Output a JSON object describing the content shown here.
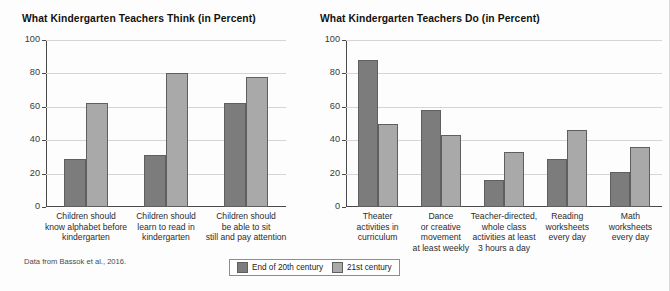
{
  "source_note": "Data from Bassok et al., 2016.",
  "legend": {
    "position": "bottom-center",
    "items": [
      {
        "label": "End of 20th century",
        "color": "#7c7c7c"
      },
      {
        "label": "21st century",
        "color": "#a9a9a9"
      }
    ]
  },
  "chart_data": [
    {
      "type": "bar",
      "title": "What Kindergarten Teachers Think (in Percent)",
      "xlabel": "",
      "ylabel": "",
      "ylim": [
        0,
        100
      ],
      "yticks": [
        0,
        20,
        40,
        60,
        80,
        100
      ],
      "grid": true,
      "categories": [
        "Children should know alphabet before kindergarten",
        "Children should learn to read in kindergarten",
        "Children should be able to sit still and pay attention"
      ],
      "category_lines": [
        [
          "Children should",
          "know alphabet before",
          "kindergarten"
        ],
        [
          "Children should",
          "learn to read in",
          "kindergarten"
        ],
        [
          "Children should",
          "be able to sit",
          "still and pay attention"
        ]
      ],
      "series": [
        {
          "name": "End of 20th century",
          "color": "#7c7c7c",
          "values": [
            29,
            31,
            62
          ]
        },
        {
          "name": "21st century",
          "color": "#a9a9a9",
          "values": [
            62,
            80,
            78
          ]
        }
      ]
    },
    {
      "type": "bar",
      "title": "What Kindergarten Teachers Do (in Percent)",
      "xlabel": "",
      "ylabel": "",
      "ylim": [
        0,
        100
      ],
      "yticks": [
        0,
        20,
        40,
        60,
        80,
        100
      ],
      "grid": true,
      "categories": [
        "Theater activities in curriculum",
        "Dance or creative movement at least weekly",
        "Teacher-directed, whole class activities at least 3 hours a day",
        "Reading worksheets every day",
        "Math worksheets every day"
      ],
      "category_lines": [
        [
          "Theater",
          "activities in",
          "curriculum"
        ],
        [
          "Dance",
          "or creative",
          "movement",
          "at least weekly"
        ],
        [
          "Teacher-directed,",
          "whole class",
          "activities at least",
          "3 hours a day"
        ],
        [
          "Reading",
          "worksheets",
          "every day"
        ],
        [
          "Math",
          "worksheets",
          "every day"
        ]
      ],
      "series": [
        {
          "name": "End of 20th century",
          "color": "#7c7c7c",
          "values": [
            88,
            58,
            16,
            29,
            21
          ]
        },
        {
          "name": "21st century",
          "color": "#a9a9a9",
          "values": [
            50,
            43,
            33,
            46,
            36
          ]
        }
      ]
    }
  ]
}
